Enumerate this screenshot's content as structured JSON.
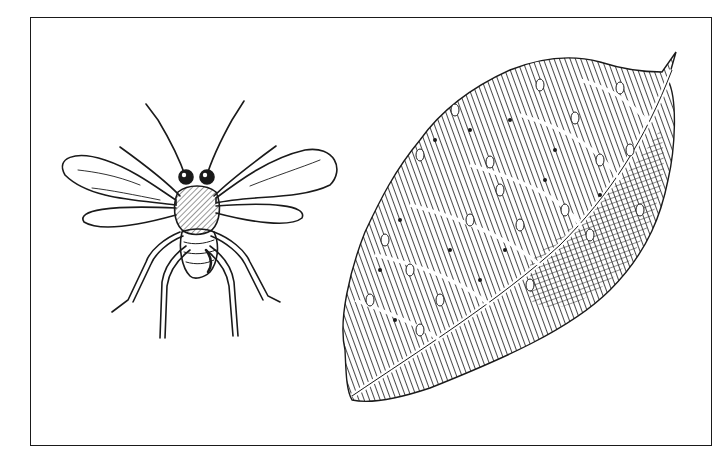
{
  "illustration": {
    "subjects": [
      {
        "name": "insect",
        "description": "small winged wasp-like insect with antennae, two pairs of wings, six legs"
      },
      {
        "name": "leaf",
        "description": "hatched leaf with midrib, veins and scattered oval spots / dots"
      }
    ],
    "style": "black ink line drawing",
    "colors": {
      "ink": "#1a1a1a",
      "background": "#ffffff"
    }
  }
}
